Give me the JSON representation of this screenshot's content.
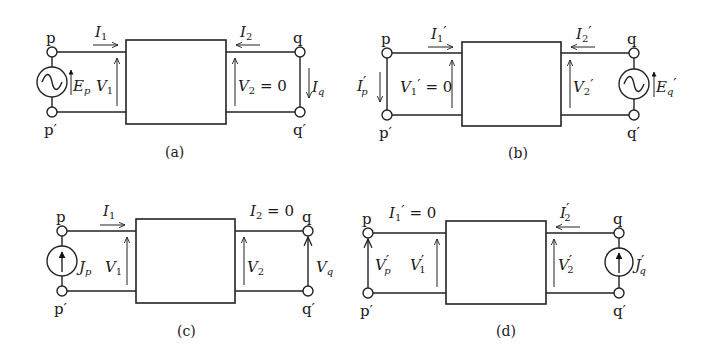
{
  "figure": {
    "panels": [
      {
        "id": "a",
        "caption": "(a)",
        "terminals": {
          "p": "p",
          "p_prime": "p′",
          "q": "q",
          "q_prime": "q′"
        },
        "source_left": {
          "type": "voltage-source",
          "label": "E",
          "sub": "p"
        },
        "labels": {
          "I1": {
            "main": "I",
            "sub": "1"
          },
          "I2": {
            "main": "I",
            "sub": "2"
          },
          "V1": {
            "main": "V",
            "sub": "1"
          },
          "V2": {
            "main": "V",
            "sub": "2",
            "suffix": " = 0"
          },
          "Iq": {
            "main": "I",
            "sub": "q"
          }
        }
      },
      {
        "id": "b",
        "caption": "(b)",
        "terminals": {
          "p": "p",
          "p_prime": "p′",
          "q": "q",
          "q_prime": "q′"
        },
        "source_right": {
          "type": "voltage-source",
          "label": "E",
          "sub": "q",
          "prime": "′"
        },
        "labels": {
          "I1": {
            "main": "I",
            "sub": "1",
            "prime": "′"
          },
          "I2": {
            "main": "I",
            "sub": "2",
            "prime": "′"
          },
          "V1": {
            "main": "V",
            "sub": "1",
            "prime": "′",
            "suffix": " = 0"
          },
          "V2": {
            "main": "V",
            "sub": "2",
            "prime": "′"
          },
          "Ip": {
            "main": "I",
            "sub": "p",
            "prime": "′"
          }
        }
      },
      {
        "id": "c",
        "caption": "(c)",
        "terminals": {
          "p": "p",
          "p_prime": "p′",
          "q": "q",
          "q_prime": "q′"
        },
        "source_left": {
          "type": "current-source",
          "label": "J",
          "sub": "p"
        },
        "labels": {
          "I1": {
            "main": "I",
            "sub": "1"
          },
          "I2": {
            "main": "I",
            "sub": "2",
            "suffix": " = 0"
          },
          "V1": {
            "main": "V",
            "sub": "1"
          },
          "V2": {
            "main": "V",
            "sub": "2"
          },
          "Vq": {
            "main": "V",
            "sub": "q"
          }
        }
      },
      {
        "id": "d",
        "caption": "(d)",
        "terminals": {
          "p": "p",
          "p_prime": "p′",
          "q": "q",
          "q_prime": "q′"
        },
        "source_right": {
          "type": "current-source",
          "label": "J",
          "sub": "q",
          "prime": "′"
        },
        "labels": {
          "I1": {
            "main": "I",
            "sub": "1",
            "prime": "′",
            "suffix": " = 0"
          },
          "I2": {
            "main": "I",
            "sub": "2",
            "prime": "′"
          },
          "V1": {
            "main": "V",
            "sub": "1",
            "prime": "′"
          },
          "V2": {
            "main": "V",
            "sub": "2",
            "prime": "′"
          },
          "Vp": {
            "main": "V",
            "sub": "p",
            "prime": "′"
          }
        }
      }
    ]
  }
}
